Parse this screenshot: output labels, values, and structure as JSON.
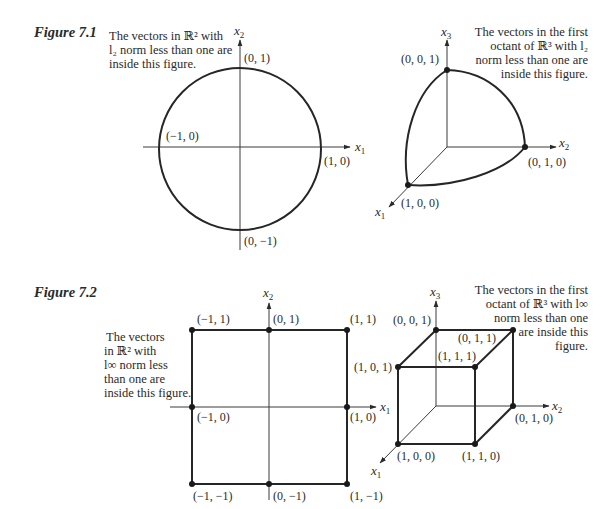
{
  "figure_7_1": {
    "title": "Figure 7.1",
    "left_panel": {
      "caption_lines": [
        "The vectors in ℝ² with",
        "l₂  norm less than one are",
        "inside this figure."
      ],
      "axis_x": "x",
      "axis_x_sub": "1",
      "axis_y": "x",
      "axis_y_sub": "2",
      "points": {
        "top": "(0, 1)",
        "left": "(−1, 0)",
        "right": "(1, 0)",
        "bottom": "(0, −1)"
      }
    },
    "right_panel": {
      "caption_lines": [
        "The vectors in the first",
        "octant of ℝ³  with  l₂",
        "norm less than one are",
        "inside this figure."
      ],
      "axis_1": "x",
      "axis_1_sub": "1",
      "axis_2": "x",
      "axis_2_sub": "2",
      "axis_3": "x",
      "axis_3_sub": "3",
      "points": {
        "p001": "(0, 0, 1)",
        "p010": "(0, 1, 0)",
        "p100": "(1, 0, 0)"
      }
    }
  },
  "figure_7_2": {
    "title": "Figure 7.2",
    "left_panel": {
      "caption_lines": [
        "The vectors",
        "in ℝ²  with",
        "l∞  norm less",
        "than one are",
        "inside this figure."
      ],
      "axis_x": "x",
      "axis_x_sub": "1",
      "axis_y": "x",
      "axis_y_sub": "2",
      "points": {
        "tl": "(−1, 1)",
        "tc": "(0, 1)",
        "tr": "(1, 1)",
        "ml": "(−1, 0)",
        "mr": "(1, 0)",
        "bl": "(−1, −1)",
        "bc": "(0, −1)",
        "br": "(1, −1)"
      }
    },
    "right_panel": {
      "caption_lines": [
        "The vectors in the first",
        "octant of ℝ³  with  l∞",
        "norm less than one",
        "are inside  this",
        "figure."
      ],
      "axis_1": "x",
      "axis_1_sub": "1",
      "axis_2": "x",
      "axis_2_sub": "2",
      "axis_3": "x",
      "axis_3_sub": "3",
      "points": {
        "p001": "(0, 0, 1)",
        "p011": "(0, 1, 1)",
        "p101": "(1, 0, 1)",
        "p111": "(1, 1, 1)",
        "p100": "(1, 0, 0)",
        "p110": "(1, 1, 0)",
        "p010": "(0, 1, 0)"
      }
    }
  }
}
